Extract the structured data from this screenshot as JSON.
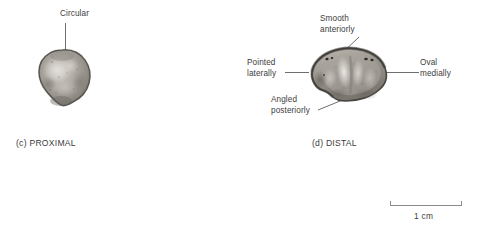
{
  "figure": {
    "background_color": "#ffffff",
    "ink_color": "#3c3c3c",
    "leader_color": "#6e6e6e",
    "specimen_rim_color": "#4a4742",
    "specimen_body_color": "#9b9790"
  },
  "panels": [
    {
      "id": "proximal",
      "caption": "(c) PROXIMAL",
      "specimen_name": "proximal-articular-surface",
      "annotations": [
        {
          "name": "circular",
          "text": "Circular"
        }
      ]
    },
    {
      "id": "distal",
      "caption": "(d) DISTAL",
      "specimen_name": "distal-articular-surface",
      "annotations": [
        {
          "name": "smooth-anteriorly",
          "text": "Smooth\nanteriorly"
        },
        {
          "name": "pointed-laterally",
          "text": "Pointed\nlaterally"
        },
        {
          "name": "oval-medially",
          "text": "Oval\nmedially"
        },
        {
          "name": "angled-posteriorly",
          "text": "Angled\nposteriorly"
        }
      ]
    }
  ],
  "scale_bar": {
    "label": "1 cm",
    "length_px": 72
  }
}
